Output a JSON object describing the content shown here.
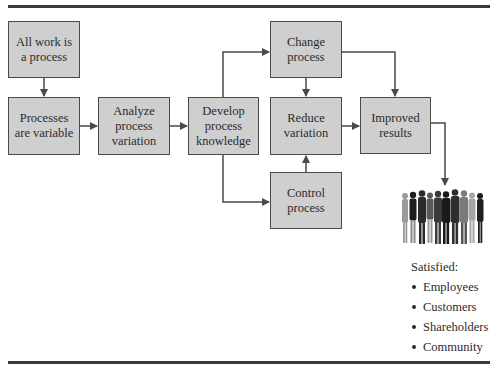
{
  "diagram": {
    "boxes": {
      "all_work": "All work is a process",
      "processes_variable": "Processes are variable",
      "analyze": "Analyze process variation",
      "develop": "Develop process knowledge",
      "change": "Change process",
      "reduce": "Reduce variation",
      "control": "Control process",
      "improved": "Improved results"
    },
    "outcome": {
      "title": "Satisfied:",
      "items": [
        "Employees",
        "Customers",
        "Shareholders",
        "Community"
      ]
    },
    "icons": {
      "people": "group-of-people-icon"
    },
    "colors": {
      "box_fill": "#cfcfcf",
      "box_border": "#4a4a4a",
      "line": "#4a4a4a",
      "rule": "#3a3a3a"
    },
    "edges": [
      [
        "All work is a process",
        "Processes are variable"
      ],
      [
        "Processes are variable",
        "Analyze process variation"
      ],
      [
        "Analyze process variation",
        "Develop process knowledge"
      ],
      [
        "Develop process knowledge",
        "Change process"
      ],
      [
        "Develop process knowledge",
        "Control process"
      ],
      [
        "Change process",
        "Reduce variation"
      ],
      [
        "Control process",
        "Reduce variation"
      ],
      [
        "Change process",
        "Improved results"
      ],
      [
        "Reduce variation",
        "Improved results"
      ],
      [
        "Improved results",
        "Satisfied stakeholders"
      ]
    ]
  }
}
